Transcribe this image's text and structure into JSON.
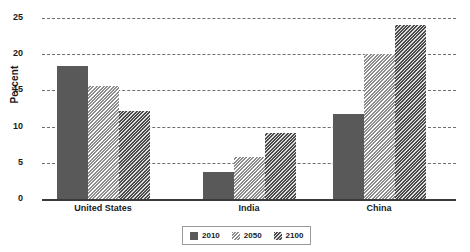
{
  "chart_data": {
    "type": "bar",
    "title": "",
    "subtitle": "",
    "xlabel": "",
    "ylabel": "Percent",
    "categories": [
      "United States",
      "India",
      "China"
    ],
    "series": [
      {
        "name": "2010",
        "values": [
          18.4,
          3.8,
          11.8
        ],
        "color": "#595959",
        "pattern": "solid"
      },
      {
        "name": "2050",
        "values": [
          15.6,
          5.8,
          20.0
        ],
        "color": "#c9c9c9",
        "pattern": "diagonal-hatch-light"
      },
      {
        "name": "2100",
        "values": [
          12.1,
          9.1,
          24.1
        ],
        "color": "#7a7a7a",
        "pattern": "diagonal-hatch-dark"
      }
    ],
    "ylim": [
      0,
      25
    ],
    "yticks": [
      0,
      5,
      10,
      15,
      20,
      25
    ],
    "ytick_labels": [
      "0",
      "5",
      "10",
      "15",
      "20",
      "25"
    ],
    "grid": true,
    "grid_style": "dashed-horizontal",
    "legend": {
      "position": "bottom-center",
      "entries": [
        "2010",
        "2050",
        "2100"
      ]
    }
  },
  "axis": {
    "y_title": "Percent"
  },
  "colors": {
    "series_2010": "#595959",
    "series_2050": "#c9c9c9",
    "series_2100": "#7a7a7a",
    "gridline": "#6f6f6f",
    "axis_line": "#3a3a3a",
    "background": "#ffffff",
    "text": "#1a1a1a"
  }
}
